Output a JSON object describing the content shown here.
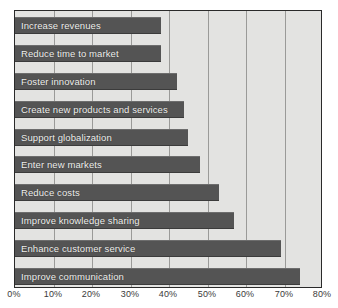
{
  "chart_data": {
    "type": "bar",
    "orientation": "horizontal",
    "title": "",
    "xlabel": "",
    "ylabel": "",
    "xlim": [
      0,
      80
    ],
    "xtick_step": 10,
    "grid": true,
    "legend": false,
    "bar_label_position": "inside-left",
    "categories": [
      "Increase revenues",
      "Reduce time to market",
      "Foster innovation",
      "Create new products and services",
      "Support globalization",
      "Enter new markets",
      "Reduce costs",
      "Improve knowledge sharing",
      "Enhance customer service",
      "Improve communication"
    ],
    "values": [
      38,
      38,
      42,
      44,
      45,
      48,
      53,
      57,
      69,
      74
    ],
    "tick_labels": [
      "0%",
      "10%",
      "20%",
      "30%",
      "40%",
      "50%",
      "60%",
      "70%",
      "80%"
    ],
    "tick_values": [
      0,
      10,
      20,
      30,
      40,
      50,
      60,
      70,
      80
    ],
    "colors": {
      "bar": "#545454",
      "plot_background": "#e3e3e1",
      "gridline": "#9a9a98",
      "border": "#2a2a2a",
      "bar_label_text": "#f2f2f0",
      "tick_label_text": "#3a3a3a"
    }
  }
}
